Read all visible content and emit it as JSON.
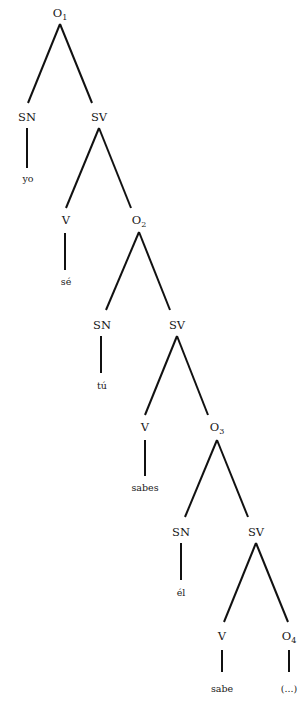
{
  "diagram": {
    "type": "syntax-tree",
    "root": "O1",
    "nodes": [
      {
        "id": "O1",
        "label": "O",
        "sub": "1",
        "x": 60,
        "y": 17
      },
      {
        "id": "SN1",
        "label": "SN",
        "x": 27,
        "y": 121
      },
      {
        "id": "SV1",
        "label": "SV",
        "x": 99,
        "y": 121
      },
      {
        "id": "yo",
        "label": "yo",
        "x": 28,
        "y": 182,
        "leaf": true
      },
      {
        "id": "V1",
        "label": "V",
        "x": 66,
        "y": 224
      },
      {
        "id": "O2",
        "label": "O",
        "sub": "2",
        "x": 139,
        "y": 224
      },
      {
        "id": "se",
        "label": "sé",
        "x": 66,
        "y": 285,
        "leaf": true
      },
      {
        "id": "SN2",
        "label": "SN",
        "x": 102,
        "y": 329
      },
      {
        "id": "SV2",
        "label": "SV",
        "x": 177,
        "y": 329
      },
      {
        "id": "tu",
        "label": "tú",
        "x": 102,
        "y": 389,
        "leaf": true
      },
      {
        "id": "V2",
        "label": "V",
        "x": 145,
        "y": 431
      },
      {
        "id": "O3",
        "label": "O",
        "sub": "3",
        "x": 217,
        "y": 431
      },
      {
        "id": "sabes",
        "label": "sabes",
        "x": 145,
        "y": 491,
        "leaf": true
      },
      {
        "id": "SN3",
        "label": "SN",
        "x": 181,
        "y": 536
      },
      {
        "id": "SV3",
        "label": "SV",
        "x": 256,
        "y": 536
      },
      {
        "id": "el",
        "label": "él",
        "x": 181,
        "y": 596,
        "leaf": true
      },
      {
        "id": "V3",
        "label": "V",
        "x": 222,
        "y": 640
      },
      {
        "id": "O4",
        "label": "O",
        "sub": "4",
        "x": 289,
        "y": 640
      },
      {
        "id": "sabe",
        "label": "sabe",
        "x": 222,
        "y": 692,
        "leaf": true
      },
      {
        "id": "ellipsis",
        "label": "(...)",
        "x": 289,
        "y": 692,
        "leaf": true
      }
    ],
    "edges": [
      {
        "from": "O1",
        "to": "SN1",
        "x1": 60,
        "y1": 24,
        "x2": 28,
        "y2": 103
      },
      {
        "from": "O1",
        "to": "SV1",
        "x1": 60,
        "y1": 24,
        "x2": 92,
        "y2": 103
      },
      {
        "from": "SN1",
        "to": "yo",
        "x1": 27,
        "y1": 128,
        "x2": 27,
        "y2": 168
      },
      {
        "from": "SV1",
        "to": "V1",
        "x1": 99,
        "y1": 128,
        "x2": 66,
        "y2": 208
      },
      {
        "from": "SV1",
        "to": "O2",
        "x1": 99,
        "y1": 128,
        "x2": 131,
        "y2": 208
      },
      {
        "from": "V1",
        "to": "se",
        "x1": 65,
        "y1": 233,
        "x2": 65,
        "y2": 270
      },
      {
        "from": "O2",
        "to": "SN2",
        "x1": 139,
        "y1": 232,
        "x2": 106,
        "y2": 310
      },
      {
        "from": "O2",
        "to": "SV2",
        "x1": 139,
        "y1": 232,
        "x2": 170,
        "y2": 310
      },
      {
        "from": "SN2",
        "to": "tu",
        "x1": 101,
        "y1": 336,
        "x2": 101,
        "y2": 373
      },
      {
        "from": "SV2",
        "to": "V2",
        "x1": 177,
        "y1": 336,
        "x2": 145,
        "y2": 415
      },
      {
        "from": "SV2",
        "to": "O3",
        "x1": 177,
        "y1": 336,
        "x2": 208,
        "y2": 415
      },
      {
        "from": "V2",
        "to": "sabes",
        "x1": 145,
        "y1": 440,
        "x2": 145,
        "y2": 476
      },
      {
        "from": "O3",
        "to": "SN3",
        "x1": 217,
        "y1": 440,
        "x2": 185,
        "y2": 517
      },
      {
        "from": "O3",
        "to": "SV3",
        "x1": 217,
        "y1": 440,
        "x2": 248,
        "y2": 517
      },
      {
        "from": "SN3",
        "to": "el",
        "x1": 181,
        "y1": 543,
        "x2": 181,
        "y2": 580
      },
      {
        "from": "SV3",
        "to": "V3",
        "x1": 256,
        "y1": 543,
        "x2": 224,
        "y2": 622
      },
      {
        "from": "SV3",
        "to": "O4",
        "x1": 256,
        "y1": 543,
        "x2": 288,
        "y2": 622
      },
      {
        "from": "V3",
        "to": "sabe",
        "x1": 222,
        "y1": 650,
        "x2": 222,
        "y2": 672
      },
      {
        "from": "O4",
        "to": "ellipsis",
        "x1": 289,
        "y1": 650,
        "x2": 289,
        "y2": 672
      }
    ]
  },
  "labels": {
    "O1": "O",
    "O1_sub": "1",
    "SN1": "SN",
    "SV1": "SV",
    "yo": "yo",
    "V1": "V",
    "O2": "O",
    "O2_sub": "2",
    "se": "sé",
    "SN2": "SN",
    "SV2": "SV",
    "tu": "tú",
    "V2": "V",
    "O3": "O",
    "O3_sub": "3",
    "sabes": "sabes",
    "SN3": "SN",
    "SV3": "SV",
    "el": "él",
    "V3": "V",
    "O4": "O",
    "O4_sub": "4",
    "sabe": "sabe",
    "ellipsis": "(...)"
  }
}
